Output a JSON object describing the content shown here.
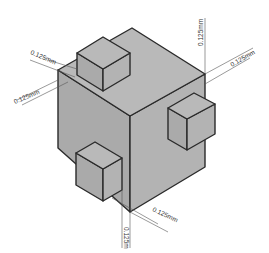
{
  "diagram": {
    "type": "isometric-cube-with-protrusions",
    "colors": {
      "top_face": "#b9b9b9",
      "left_face": "#aaaaaa",
      "right_face": "#b3b3b3",
      "edge": "#2a2a2a",
      "background": "#ffffff"
    },
    "dimensions": {
      "top_left_upper": "0.125mm",
      "top_left_lower": "0.125mm",
      "top_right_vertical": "0.125mm",
      "top_right_diagonal": "0.125mm",
      "bottom_diagonal": "0.125mm",
      "bottom_vertical": "0.125m"
    }
  }
}
